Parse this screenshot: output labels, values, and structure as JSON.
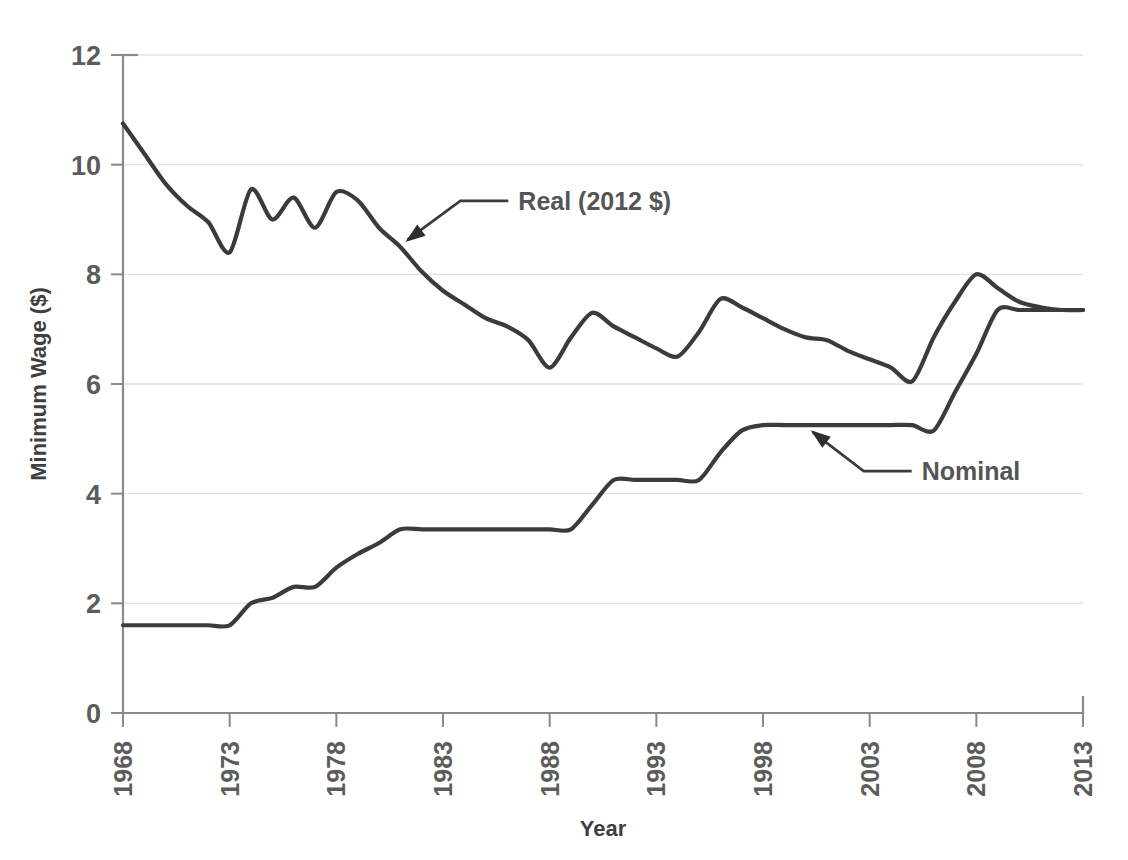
{
  "chart_data": {
    "type": "line",
    "title": "",
    "xlabel": "Year",
    "ylabel": "Minimum Wage ($)",
    "xlim": [
      1968,
      2013
    ],
    "ylim": [
      0,
      12
    ],
    "grid": true,
    "legend_position": "inline-annotations",
    "xticks": [
      "1968",
      "1973",
      "1978",
      "1983",
      "1988",
      "1993",
      "1998",
      "2003",
      "2008",
      "2013"
    ],
    "xtick_values": [
      1968,
      1973,
      1978,
      1983,
      1988,
      1993,
      1998,
      2003,
      2008,
      2013
    ],
    "yticks": [
      "0",
      "2",
      "4",
      "6",
      "8",
      "10",
      "12"
    ],
    "ytick_values": [
      0,
      2,
      4,
      6,
      8,
      10,
      12
    ],
    "x": [
      1968,
      1969,
      1970,
      1971,
      1972,
      1973,
      1974,
      1975,
      1976,
      1977,
      1978,
      1979,
      1980,
      1981,
      1982,
      1983,
      1984,
      1985,
      1986,
      1987,
      1988,
      1989,
      1990,
      1991,
      1992,
      1993,
      1994,
      1995,
      1996,
      1997,
      1998,
      1999,
      2000,
      2001,
      2002,
      2003,
      2004,
      2005,
      2006,
      2007,
      2008,
      2009,
      2010,
      2011,
      2012,
      2013
    ],
    "series": [
      {
        "name": "Real (2012 $)",
        "values": [
          10.75,
          10.2,
          9.65,
          9.25,
          8.95,
          8.4,
          9.55,
          9.0,
          9.4,
          8.85,
          9.5,
          9.35,
          8.85,
          8.5,
          8.05,
          7.7,
          7.45,
          7.2,
          7.05,
          6.8,
          6.3,
          6.85,
          7.3,
          7.05,
          6.85,
          6.65,
          6.5,
          6.95,
          7.55,
          7.4,
          7.2,
          7.0,
          6.85,
          6.8,
          6.6,
          6.45,
          6.3,
          6.05,
          6.85,
          7.5,
          8.0,
          7.75,
          7.5,
          7.4,
          7.35,
          7.35
        ]
      },
      {
        "name": "Nominal",
        "values": [
          1.6,
          1.6,
          1.6,
          1.6,
          1.6,
          1.6,
          2.0,
          2.1,
          2.3,
          2.3,
          2.65,
          2.9,
          3.1,
          3.35,
          3.35,
          3.35,
          3.35,
          3.35,
          3.35,
          3.35,
          3.35,
          3.35,
          3.8,
          4.25,
          4.25,
          4.25,
          4.25,
          4.25,
          4.75,
          5.15,
          5.25,
          5.25,
          5.25,
          5.25,
          5.25,
          5.25,
          5.25,
          5.25,
          5.15,
          5.85,
          6.55,
          7.35,
          7.35,
          7.35,
          7.35,
          7.35
        ]
      }
    ],
    "annotations": [
      {
        "label": "Real (2012 $)",
        "series": "Real (2012 $)",
        "point_year": 1981,
        "point_value": 8.5
      },
      {
        "label": "Nominal",
        "series": "Nominal",
        "point_year": 2000,
        "point_value": 5.25
      }
    ],
    "colors": {
      "line": "#3b3b3b",
      "axis": "#8a8a8a",
      "grid": "#e2e2e2",
      "text": "#5c5c5c",
      "background": "#ffffff"
    }
  }
}
